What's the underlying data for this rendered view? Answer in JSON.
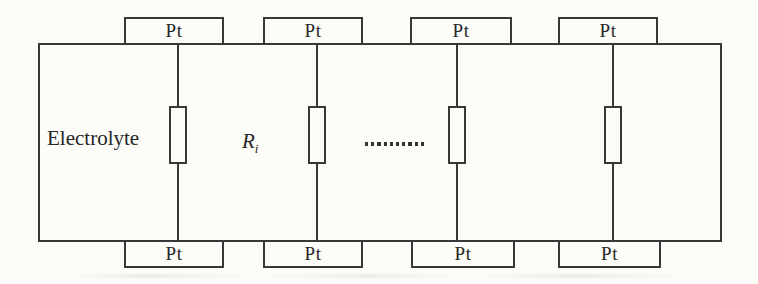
{
  "diagram": {
    "type": "schematic",
    "colors": {
      "background": "#fcfcf9",
      "line": "#383838",
      "text": "#262626"
    },
    "electrolyte_label": "Electrolyte",
    "resistance": {
      "base": "R",
      "subscript": "i"
    },
    "separator_dots": "..........",
    "top_electrodes": [
      {
        "label": "Pt"
      },
      {
        "label": "Pt"
      },
      {
        "label": "Pt"
      },
      {
        "label": "Pt"
      }
    ],
    "bottom_electrodes": [
      {
        "label": "Pt"
      },
      {
        "label": "Pt"
      },
      {
        "label": "Pt"
      },
      {
        "label": "Pt"
      }
    ]
  }
}
